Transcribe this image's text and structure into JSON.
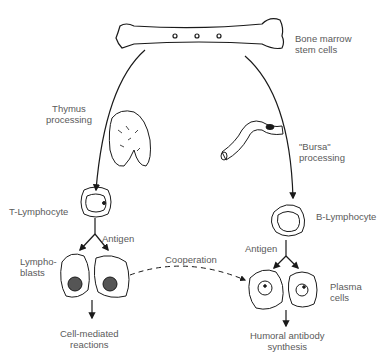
{
  "labels": {
    "bone_marrow": "Bone marrow\nstem cells",
    "thymus": "Thymus\nprocessing",
    "bursa": "\"Bursa\"\nprocessing",
    "t_lymphocyte": "T-Lymphocyte",
    "b_lymphocyte": "B-Lymphocyte",
    "antigen_left": "Antigen",
    "antigen_right": "Antigen",
    "lymphoblasts": "Lympho-\nblasts",
    "cooperation": "Cooperation",
    "plasma_cells": "Plasma\ncells",
    "cell_mediated": "Cell-mediated\nreactions",
    "humoral": "Humoral antibody\nsynthesis"
  },
  "colors": {
    "line": "#1a1a1a",
    "text": "#5a5a5a"
  }
}
